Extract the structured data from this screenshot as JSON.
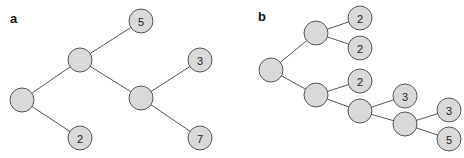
{
  "colors": {
    "node_fill": "#d9d9d9",
    "node_stroke": "#555555",
    "edge": "#555555",
    "text": "#222222"
  },
  "panels": [
    {
      "label": "a",
      "label_pos": [
        10,
        23
      ],
      "nodes": [
        {
          "id": "a1",
          "x": 80,
          "y": 60,
          "label": ""
        },
        {
          "id": "a2",
          "x": 141,
          "y": 21,
          "label": "5"
        },
        {
          "id": "a3",
          "x": 22,
          "y": 100,
          "label": ""
        },
        {
          "id": "a4",
          "x": 80,
          "y": 138,
          "label": "2"
        },
        {
          "id": "a5",
          "x": 141,
          "y": 98,
          "label": ""
        },
        {
          "id": "a6",
          "x": 200,
          "y": 60,
          "label": "3"
        },
        {
          "id": "a7",
          "x": 200,
          "y": 138,
          "label": "7"
        }
      ],
      "edges": [
        [
          "a1",
          "a2"
        ],
        [
          "a1",
          "a3"
        ],
        [
          "a1",
          "a5"
        ],
        [
          "a3",
          "a4"
        ],
        [
          "a5",
          "a6"
        ],
        [
          "a5",
          "a7"
        ]
      ]
    },
    {
      "label": "b",
      "label_pos": [
        258,
        21
      ],
      "nodes": [
        {
          "id": "b1",
          "x": 271,
          "y": 70,
          "label": ""
        },
        {
          "id": "b2",
          "x": 316,
          "y": 33,
          "label": ""
        },
        {
          "id": "b3",
          "x": 360,
          "y": 18,
          "label": "2"
        },
        {
          "id": "b4",
          "x": 360,
          "y": 48,
          "label": "2"
        },
        {
          "id": "b5",
          "x": 316,
          "y": 95,
          "label": ""
        },
        {
          "id": "b6",
          "x": 360,
          "y": 81,
          "label": "2"
        },
        {
          "id": "b7",
          "x": 360,
          "y": 111,
          "label": ""
        },
        {
          "id": "b8",
          "x": 405,
          "y": 96,
          "label": "3"
        },
        {
          "id": "b9",
          "x": 405,
          "y": 124,
          "label": ""
        },
        {
          "id": "b10",
          "x": 449,
          "y": 110,
          "label": "3"
        },
        {
          "id": "b11",
          "x": 449,
          "y": 139,
          "label": "5"
        }
      ],
      "edges": [
        [
          "b1",
          "b2"
        ],
        [
          "b1",
          "b5"
        ],
        [
          "b2",
          "b3"
        ],
        [
          "b2",
          "b4"
        ],
        [
          "b5",
          "b6"
        ],
        [
          "b5",
          "b7"
        ],
        [
          "b7",
          "b8"
        ],
        [
          "b7",
          "b9"
        ],
        [
          "b9",
          "b10"
        ],
        [
          "b9",
          "b11"
        ]
      ]
    }
  ],
  "node_radius": 12
}
